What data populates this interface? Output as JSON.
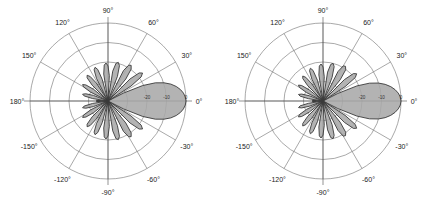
{
  "figure": {
    "panel_count": 2,
    "background_color": "#ffffff",
    "lobe_fill_color": "#a8a8a8",
    "lobe_stroke_color": "#3a3a3a",
    "grid_color": "#6e6e6e"
  },
  "chart_data": [
    {
      "type": "line",
      "subtype": "polar-radiation-pattern",
      "title": "",
      "xlabel": "",
      "ylabel": "",
      "grid": true,
      "legend_position": "none",
      "angle_unit": "degrees",
      "radial_unit": "dB",
      "angle_ticks": [
        "90°",
        "60°",
        "30°",
        "0°",
        "-30°",
        "-60°",
        "-90°",
        "-120°",
        "-150°",
        "180°",
        "150°",
        "120°"
      ],
      "angle_tick_values": [
        90,
        60,
        30,
        0,
        -30,
        -60,
        -90,
        -120,
        -150,
        180,
        150,
        120
      ],
      "radial_ticks": [
        "-20",
        "-10",
        "0"
      ],
      "radial_tick_values": [
        -20,
        -10,
        0
      ],
      "rlim": [
        -40,
        0
      ],
      "ring_count": 4,
      "series": [
        {
          "name": "pattern",
          "theta": [
            0,
            3,
            6,
            9,
            12,
            15,
            18,
            21,
            24,
            27,
            30,
            33,
            36,
            39,
            42,
            45,
            48,
            51,
            54,
            57,
            60,
            63,
            66,
            69,
            72,
            75,
            78,
            81,
            84,
            87,
            90,
            93,
            96,
            99,
            102,
            105,
            108,
            111,
            114,
            117,
            120,
            123,
            126,
            129,
            132,
            135,
            138,
            141,
            144,
            147,
            150,
            153,
            156,
            159,
            162,
            165,
            168,
            171,
            174,
            177,
            180,
            183,
            186,
            189,
            192,
            195,
            198,
            201,
            204,
            207,
            210,
            213,
            216,
            219,
            222,
            225,
            228,
            231,
            234,
            237,
            240,
            243,
            246,
            249,
            252,
            255,
            258,
            261,
            264,
            267,
            270,
            273,
            276,
            279,
            282,
            285,
            288,
            291,
            294,
            297,
            300,
            303,
            306,
            309,
            312,
            315,
            318,
            321,
            324,
            327,
            330,
            333,
            336,
            339,
            342,
            345,
            348,
            351,
            354,
            357
          ],
          "values_db": [
            0,
            -0.3,
            -1.1,
            -2.4,
            -4.2,
            -6.6,
            -9.8,
            -14.0,
            -20.5,
            -31.0,
            -40,
            -26.0,
            -19.0,
            -17.2,
            -18.5,
            -24.0,
            -40,
            -25.5,
            -19.8,
            -18.2,
            -18.8,
            -22.5,
            -40,
            -26.5,
            -21.0,
            -19.5,
            -20.2,
            -24.5,
            -40,
            -27.0,
            -22.0,
            -20.5,
            -21.5,
            -26.0,
            -40,
            -28.5,
            -23.0,
            -21.5,
            -22.5,
            -27.0,
            -40,
            -29.0,
            -24.5,
            -23.0,
            -24.0,
            -28.5,
            -40,
            -30.5,
            -26.0,
            -24.5,
            -25.5,
            -30.0,
            -40,
            -32.0,
            -28.0,
            -26.5,
            -27.5,
            -32.0,
            -40,
            -34.0,
            -36.0,
            -34.0,
            -40,
            -32.0,
            -27.5,
            -26.5,
            -28.0,
            -32.0,
            -40,
            -30.0,
            -25.5,
            -24.5,
            -26.0,
            -30.5,
            -40,
            -28.5,
            -24.0,
            -23.0,
            -24.5,
            -29.0,
            -40,
            -27.0,
            -22.5,
            -21.5,
            -23.0,
            -28.5,
            -40,
            -26.0,
            -21.5,
            -20.5,
            -22.0,
            -27.0,
            -40,
            -24.5,
            -20.2,
            -19.5,
            -21.0,
            -26.5,
            -40,
            -22.5,
            -18.8,
            -18.2,
            -19.8,
            -25.5,
            -40,
            -24.0,
            -18.5,
            -17.2,
            -19.0,
            -26.0,
            -40,
            -31.0,
            -20.5,
            -14.0,
            -9.8,
            -6.6,
            -4.2,
            -2.4,
            -1.1,
            -0.3
          ]
        }
      ]
    },
    {
      "type": "line",
      "subtype": "polar-radiation-pattern",
      "title": "",
      "xlabel": "",
      "ylabel": "",
      "grid": true,
      "legend_position": "none",
      "angle_unit": "degrees",
      "radial_unit": "dB",
      "angle_ticks": [
        "90°",
        "60°",
        "30°",
        "0°",
        "-30°",
        "-60°",
        "-90°",
        "-120°",
        "-150°",
        "180°",
        "150°",
        "120°"
      ],
      "angle_tick_values": [
        90,
        60,
        30,
        0,
        -30,
        -60,
        -90,
        -120,
        -150,
        180,
        150,
        120
      ],
      "radial_ticks": [
        "-20",
        "-10",
        "0"
      ],
      "radial_tick_values": [
        -20,
        -10,
        0
      ],
      "rlim": [
        -40,
        0
      ],
      "ring_count": 4,
      "series": [
        {
          "name": "pattern",
          "theta": [
            0,
            3,
            6,
            9,
            12,
            15,
            18,
            21,
            24,
            27,
            30,
            33,
            36,
            39,
            42,
            45,
            48,
            51,
            54,
            57,
            60,
            63,
            66,
            69,
            72,
            75,
            78,
            81,
            84,
            87,
            90,
            93,
            96,
            99,
            102,
            105,
            108,
            111,
            114,
            117,
            120,
            123,
            126,
            129,
            132,
            135,
            138,
            141,
            144,
            147,
            150,
            153,
            156,
            159,
            162,
            165,
            168,
            171,
            174,
            177,
            180,
            183,
            186,
            189,
            192,
            195,
            198,
            201,
            204,
            207,
            210,
            213,
            216,
            219,
            222,
            225,
            228,
            231,
            234,
            237,
            240,
            243,
            246,
            249,
            252,
            255,
            258,
            261,
            264,
            267,
            270,
            273,
            276,
            279,
            282,
            285,
            288,
            291,
            294,
            297,
            300,
            303,
            306,
            309,
            312,
            315,
            318,
            321,
            324,
            327,
            330,
            333,
            336,
            339,
            342,
            345,
            348,
            351,
            354,
            357
          ],
          "values_db": [
            0,
            -0.3,
            -1.2,
            -2.6,
            -4.5,
            -7.0,
            -10.2,
            -14.5,
            -21.0,
            -31.5,
            -40,
            -26.5,
            -19.5,
            -17.8,
            -19.0,
            -24.5,
            -40,
            -26.0,
            -20.2,
            -18.8,
            -19.2,
            -23.0,
            -40,
            -27.0,
            -21.5,
            -20.0,
            -20.8,
            -25.0,
            -40,
            -27.5,
            -22.5,
            -21.0,
            -22.0,
            -26.5,
            -40,
            -29.0,
            -23.5,
            -22.0,
            -23.0,
            -27.5,
            -40,
            -29.5,
            -25.0,
            -23.5,
            -24.5,
            -29.0,
            -40,
            -31.0,
            -26.5,
            -25.0,
            -26.0,
            -30.5,
            -40,
            -32.5,
            -28.5,
            -27.0,
            -28.0,
            -32.5,
            -40,
            -34.5,
            -36.5,
            -34.5,
            -40,
            -32.5,
            -28.0,
            -27.0,
            -28.5,
            -32.5,
            -40,
            -30.5,
            -26.0,
            -25.0,
            -26.5,
            -31.0,
            -40,
            -29.0,
            -24.5,
            -23.5,
            -25.0,
            -29.5,
            -40,
            -27.5,
            -23.0,
            -22.0,
            -23.5,
            -29.0,
            -40,
            -26.5,
            -22.0,
            -21.0,
            -22.5,
            -27.5,
            -40,
            -25.0,
            -20.8,
            -20.0,
            -21.5,
            -27.0,
            -40,
            -23.0,
            -19.2,
            -18.8,
            -20.2,
            -26.0,
            -40,
            -24.5,
            -19.0,
            -17.8,
            -19.5,
            -26.5,
            -40,
            -31.5,
            -21.0,
            -14.5,
            -10.2,
            -7.0,
            -4.5,
            -2.6,
            -1.2,
            -0.3
          ]
        }
      ]
    }
  ]
}
